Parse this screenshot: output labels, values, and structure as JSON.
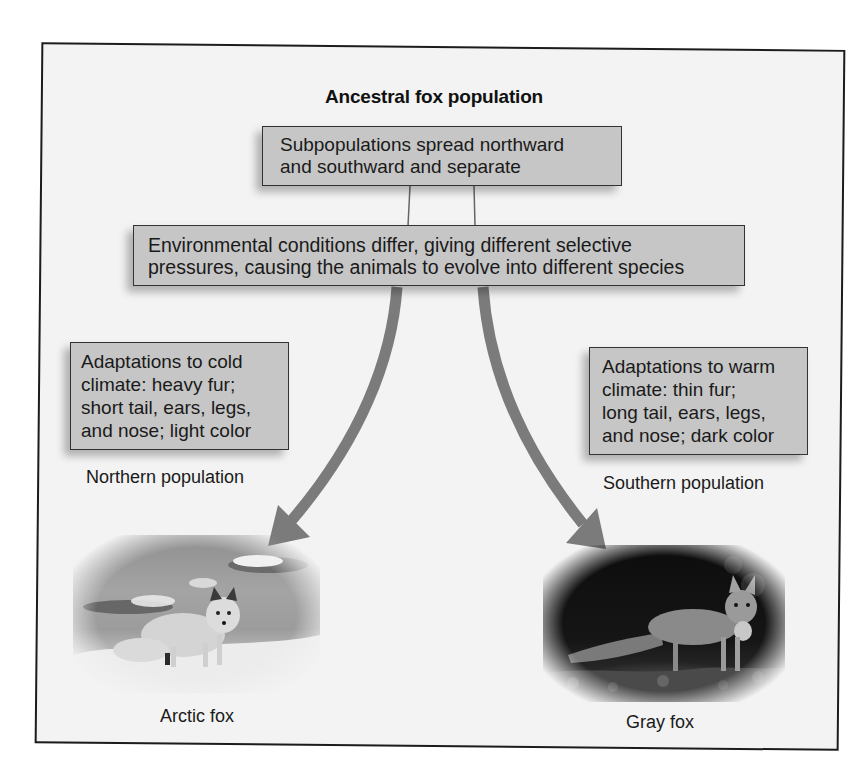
{
  "diagram": {
    "title": "Ancestral fox population",
    "steps": {
      "split": {
        "line1": "Subpopulations spread northward",
        "line2": "and southward and separate"
      },
      "selection": {
        "line1": "Environmental conditions differ, giving different selective",
        "line2": "pressures, causing the animals to evolve into different species"
      }
    },
    "branches": {
      "north": {
        "adaptations": [
          "Adaptations to cold",
          "climate: heavy fur;",
          "short tail, ears, legs,",
          "and nose; light color"
        ],
        "population_label": "Northern population",
        "species_label": "Arctic fox",
        "photo": "arctic-fox-photo"
      },
      "south": {
        "adaptations": [
          "Adaptations to warm",
          "climate: thin fur;",
          "long tail, ears, legs,",
          "and nose; dark color"
        ],
        "population_label": "Southern population",
        "species_label": "Gray fox",
        "photo": "gray-fox-photo"
      }
    },
    "colors": {
      "box_fill": "#c6c6c6",
      "box_border": "#333333",
      "arrow": "#7b7b7b",
      "frame_border": "#1c1c1c",
      "background": "#f3f3f3"
    }
  }
}
